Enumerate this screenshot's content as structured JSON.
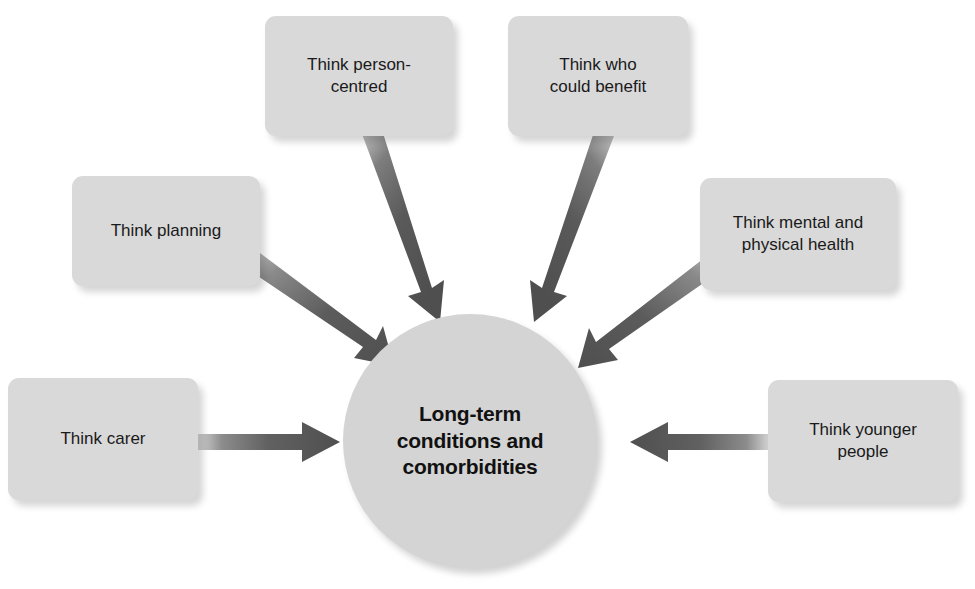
{
  "diagram": {
    "title": "Long-term conditions and comorbidities",
    "type": "hub-and-spoke",
    "center": {
      "label": "Long-term\nconditions and\ncomorbidities",
      "shape": "circle",
      "fill_color": "#d4d4d4",
      "text_color": "#111111"
    },
    "arrow_color": "#555555",
    "box_fill_color": "#d9d9d9",
    "background_color": "#ffffff",
    "nodes": [
      {
        "id": "think-planning",
        "label": "Think planning",
        "position": "upper-left",
        "arrow_direction": "down-right"
      },
      {
        "id": "think-person-centred",
        "label": "Think person-\ncentred",
        "position": "top-left-center",
        "arrow_direction": "down-right"
      },
      {
        "id": "think-who-could-benefit",
        "label": "Think who\ncould benefit",
        "position": "top-right-center",
        "arrow_direction": "down-left"
      },
      {
        "id": "think-mental-and-physical-health",
        "label": "Think mental and\nphysical health",
        "position": "upper-right",
        "arrow_direction": "down-left"
      },
      {
        "id": "think-carer",
        "label": "Think carer",
        "position": "left",
        "arrow_direction": "right"
      },
      {
        "id": "think-younger-people",
        "label": "Think younger\npeople",
        "position": "right",
        "arrow_direction": "left"
      }
    ]
  }
}
